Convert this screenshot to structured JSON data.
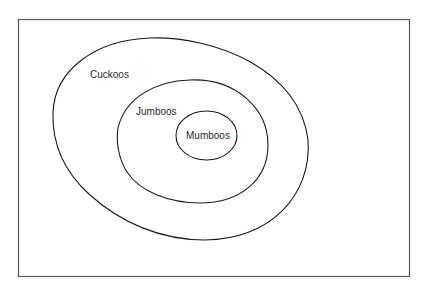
{
  "diagram": {
    "type": "euler-nested-sets",
    "sets": [
      {
        "id": "cuckoos",
        "label": "Cuckoos",
        "contains": [
          "jumboos"
        ]
      },
      {
        "id": "jumboos",
        "label": "Jumboos",
        "contains": [
          "mumboos"
        ]
      },
      {
        "id": "mumboos",
        "label": "Mumboos",
        "contains": []
      }
    ],
    "colors": {
      "background": "#ffffff",
      "stroke": "#1a1a1a",
      "frame": "#555555",
      "text": "#2a2a2a"
    }
  }
}
